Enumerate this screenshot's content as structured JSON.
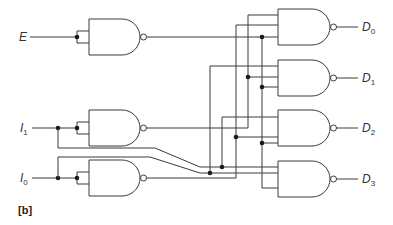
{
  "diagram": {
    "type": "logic-circuit",
    "figure_label": "[b]",
    "inputs": [
      {
        "name": "E",
        "base": "E",
        "sub": ""
      },
      {
        "name": "I1",
        "base": "I",
        "sub": "1"
      },
      {
        "name": "I0",
        "base": "I",
        "sub": "0"
      }
    ],
    "outputs": [
      {
        "name": "D0",
        "base": "D",
        "sub": "0"
      },
      {
        "name": "D1",
        "base": "D",
        "sub": "1"
      },
      {
        "name": "D2",
        "base": "D",
        "sub": "2"
      },
      {
        "name": "D3",
        "base": "D",
        "sub": "3"
      }
    ],
    "gates": [
      {
        "id": "inv-E",
        "type": "NAND",
        "inputs": [
          "E",
          "E"
        ],
        "output": "E'"
      },
      {
        "id": "inv-I1",
        "type": "NAND",
        "inputs": [
          "I1",
          "I1"
        ],
        "output": "I1'"
      },
      {
        "id": "inv-I0",
        "type": "NAND",
        "inputs": [
          "I0",
          "I0"
        ],
        "output": "I0'"
      },
      {
        "id": "out-D0",
        "type": "NAND",
        "inputs": [
          "I1'",
          "I0'",
          "E'"
        ],
        "output": "D0"
      },
      {
        "id": "out-D1",
        "type": "NAND",
        "inputs": [
          "I0",
          "I1'",
          "E'"
        ],
        "output": "D1"
      },
      {
        "id": "out-D2",
        "type": "NAND",
        "inputs": [
          "I1",
          "I0'",
          "E'"
        ],
        "output": "D2"
      },
      {
        "id": "out-D3",
        "type": "NAND",
        "inputs": [
          "I1",
          "I0",
          "E'"
        ],
        "output": "D3"
      }
    ]
  }
}
